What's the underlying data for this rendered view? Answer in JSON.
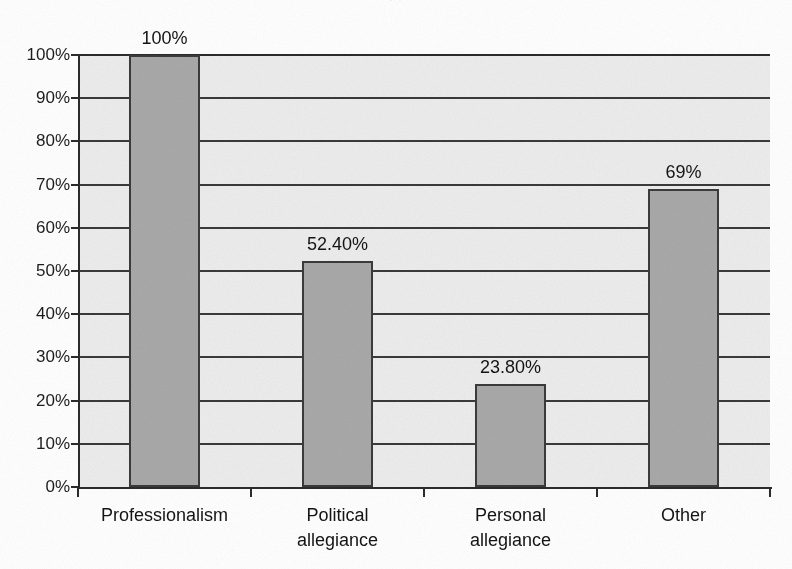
{
  "figure": {
    "title_remnant": "· ·",
    "background_color": "#ffffff",
    "plot_background_color": "#ededed",
    "bar_fill_color": "#a9a9a9",
    "bar_outline_color": "#3b3b3b",
    "gridline_color": "#3a3a3a",
    "axis_color": "#2b2b2b"
  },
  "chart_data": {
    "type": "bar",
    "title": "",
    "xlabel": "",
    "ylabel": "",
    "categories": [
      "Professionalism",
      "Political\nallegiance",
      "Personal\nallegiance",
      "Other"
    ],
    "values": [
      100,
      52.4,
      23.8,
      69
    ],
    "data_labels": [
      "100%",
      "52.40%",
      "23.80%",
      "69%"
    ],
    "ylim": [
      0,
      100
    ],
    "ytick_values": [
      0,
      10,
      20,
      30,
      40,
      50,
      60,
      70,
      80,
      90,
      100
    ],
    "ytick_labels": [
      "0%",
      "10%",
      "20%",
      "30%",
      "40%",
      "50%",
      "60%",
      "70%",
      "80%",
      "90%",
      "100%"
    ],
    "grid": true,
    "grid_axis": "y",
    "legend": null,
    "legend_position": "none",
    "series": [
      {
        "name": "",
        "values": [
          100,
          52.4,
          23.8,
          69
        ]
      }
    ]
  }
}
